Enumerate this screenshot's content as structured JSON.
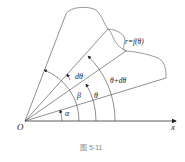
{
  "figure": {
    "caption": "图 5-11",
    "labels": {
      "origin": "O",
      "x_axis": "x",
      "curve": "r=f(θ)",
      "alpha": "α",
      "beta": "β",
      "theta": "θ",
      "dtheta": "dθ",
      "theta_plus_dtheta": "θ+dθ"
    }
  }
}
